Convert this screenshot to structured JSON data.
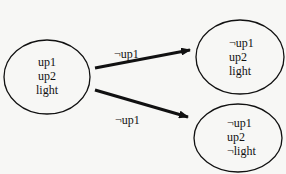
{
  "diagram": {
    "type": "state-transition",
    "colors": {
      "stroke": "#111111",
      "background": "#f7f7f5"
    },
    "nodes": [
      {
        "id": "s0",
        "lines": [
          "up1",
          "up2",
          "light"
        ]
      },
      {
        "id": "s1",
        "lines": [
          "¬up1",
          "up2",
          "light"
        ]
      },
      {
        "id": "s2",
        "lines": [
          "¬up1",
          "up2",
          "¬light"
        ]
      }
    ],
    "edges": [
      {
        "from": "s0",
        "to": "s1",
        "label": "¬up1"
      },
      {
        "from": "s0",
        "to": "s2",
        "label": "¬up1"
      }
    ]
  }
}
